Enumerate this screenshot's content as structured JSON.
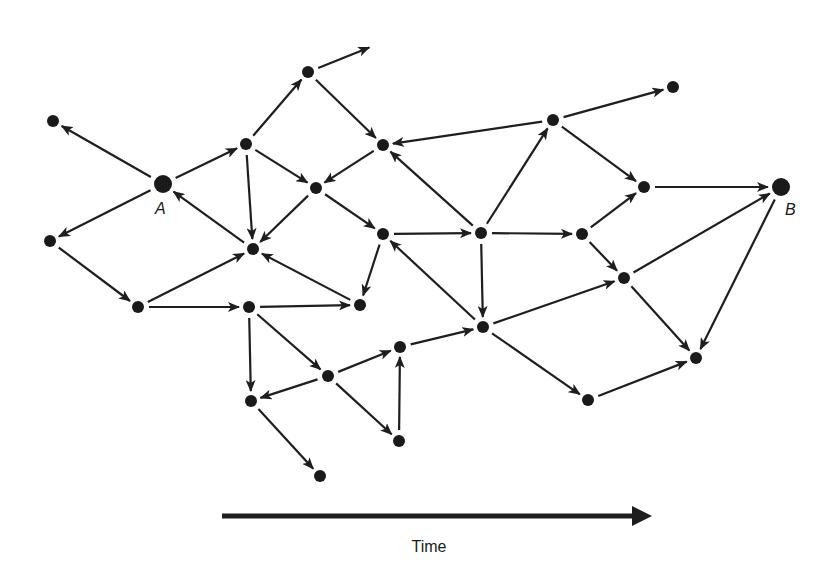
{
  "diagram": {
    "type": "directed-graph",
    "colors": {
      "ink": "#1a1a1a",
      "background": "#ffffff"
    },
    "nodes": [
      {
        "id": "n1",
        "x": 53,
        "y": 121,
        "r": 6
      },
      {
        "id": "A",
        "x": 163,
        "y": 184,
        "r": 9,
        "label": "A",
        "label_dx": -8,
        "label_dy": 30
      },
      {
        "id": "n3",
        "x": 50,
        "y": 241,
        "r": 6
      },
      {
        "id": "n4",
        "x": 138,
        "y": 307,
        "r": 6
      },
      {
        "id": "n5",
        "x": 246,
        "y": 144,
        "r": 6
      },
      {
        "id": "n6",
        "x": 308,
        "y": 72,
        "r": 6
      },
      {
        "id": "n7",
        "x": 253,
        "y": 249,
        "r": 6
      },
      {
        "id": "n8",
        "x": 316,
        "y": 188,
        "r": 6
      },
      {
        "id": "n9",
        "x": 383,
        "y": 145,
        "r": 6
      },
      {
        "id": "n10",
        "x": 383,
        "y": 234,
        "r": 6
      },
      {
        "id": "n11",
        "x": 360,
        "y": 305,
        "r": 6
      },
      {
        "id": "n12",
        "x": 249,
        "y": 307,
        "r": 6
      },
      {
        "id": "n13",
        "x": 481,
        "y": 233,
        "r": 6
      },
      {
        "id": "n14",
        "x": 553,
        "y": 120,
        "r": 6
      },
      {
        "id": "n15",
        "x": 673,
        "y": 87,
        "r": 6
      },
      {
        "id": "n16",
        "x": 582,
        "y": 234,
        "r": 6
      },
      {
        "id": "n17",
        "x": 644,
        "y": 187,
        "r": 6
      },
      {
        "id": "B",
        "x": 781,
        "y": 187,
        "r": 9,
        "label": "B",
        "label_dx": 4,
        "label_dy": 28
      },
      {
        "id": "n19",
        "x": 624,
        "y": 278,
        "r": 6
      },
      {
        "id": "n20",
        "x": 696,
        "y": 358,
        "r": 6
      },
      {
        "id": "n21",
        "x": 588,
        "y": 400,
        "r": 6
      },
      {
        "id": "n22",
        "x": 483,
        "y": 327,
        "r": 6
      },
      {
        "id": "n23",
        "x": 400,
        "y": 347,
        "r": 6
      },
      {
        "id": "n24",
        "x": 328,
        "y": 376,
        "r": 6
      },
      {
        "id": "n25",
        "x": 251,
        "y": 401,
        "r": 6
      },
      {
        "id": "n26",
        "x": 399,
        "y": 441,
        "r": 6
      },
      {
        "id": "n27",
        "x": 320,
        "y": 476,
        "r": 6
      }
    ],
    "edges": [
      {
        "from": "A",
        "to": "n1"
      },
      {
        "from": "A",
        "to": "n5"
      },
      {
        "from": "A",
        "to": "n3"
      },
      {
        "from": "n7",
        "to": "A"
      },
      {
        "from": "n3",
        "to": "n4"
      },
      {
        "from": "n4",
        "to": "n7"
      },
      {
        "from": "n4",
        "to": "n12"
      },
      {
        "from": "n5",
        "to": "n6"
      },
      {
        "from": "n5",
        "to": "n8"
      },
      {
        "from": "n5",
        "to": "n7"
      },
      {
        "from": "n6",
        "to": "open-end-1"
      },
      {
        "from": "n6",
        "to": "n9"
      },
      {
        "from": "n9",
        "to": "n8"
      },
      {
        "from": "n8",
        "to": "n7"
      },
      {
        "from": "n8",
        "to": "n10"
      },
      {
        "from": "n11",
        "to": "n7"
      },
      {
        "from": "n10",
        "to": "n11"
      },
      {
        "from": "n10",
        "to": "n13"
      },
      {
        "from": "n12",
        "to": "n11"
      },
      {
        "from": "n12",
        "to": "n25"
      },
      {
        "from": "n12",
        "to": "n24"
      },
      {
        "from": "n14",
        "to": "n9"
      },
      {
        "from": "n13",
        "to": "n9"
      },
      {
        "from": "n13",
        "to": "n14"
      },
      {
        "from": "n13",
        "to": "n16"
      },
      {
        "from": "n13",
        "to": "n22"
      },
      {
        "from": "n22",
        "to": "n10"
      },
      {
        "from": "n14",
        "to": "n15"
      },
      {
        "from": "n14",
        "to": "n17"
      },
      {
        "from": "n16",
        "to": "n17"
      },
      {
        "from": "n16",
        "to": "n19"
      },
      {
        "from": "n17",
        "to": "B"
      },
      {
        "from": "n19",
        "to": "B"
      },
      {
        "from": "B",
        "to": "n20"
      },
      {
        "from": "n19",
        "to": "n20"
      },
      {
        "from": "n22",
        "to": "n19"
      },
      {
        "from": "n22",
        "to": "n21"
      },
      {
        "from": "n21",
        "to": "n20"
      },
      {
        "from": "n23",
        "to": "n22"
      },
      {
        "from": "n24",
        "to": "n23"
      },
      {
        "from": "n24",
        "to": "n25"
      },
      {
        "from": "n24",
        "to": "n26"
      },
      {
        "from": "n26",
        "to": "n23"
      },
      {
        "from": "n25",
        "to": "n27"
      }
    ],
    "open_ends": [
      {
        "id": "open-end-1",
        "x": 373,
        "y": 46
      }
    ],
    "time_axis": {
      "label": "Time",
      "x1": 222,
      "y": 516,
      "x2": 638,
      "label_x": 429,
      "label_y": 538
    }
  }
}
